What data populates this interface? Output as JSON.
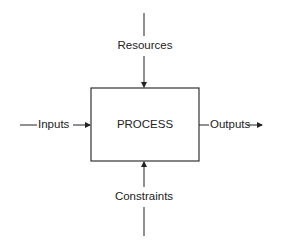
{
  "diagram": {
    "process_label": "PROCESS",
    "inputs_label": "Inputs",
    "outputs_label": "Outputs",
    "resources_label": "Resources",
    "constraints_label": "Constraints",
    "line_color": "#222222"
  }
}
